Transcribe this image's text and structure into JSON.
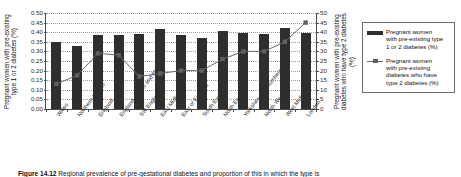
{
  "chart_data": {
    "type": "bar",
    "title": "",
    "categories": [
      "Wales",
      "Northern Ireland",
      "England",
      "England, Wales and NI",
      "SW England",
      "East Midlands",
      "East of England",
      "South East",
      "North East",
      "Yorkshire and Humberside",
      "North West",
      "West Midlands",
      "London"
    ],
    "series": [
      {
        "name": "Pregnant women with pre-existing type 1 or 2 diabetes (%)",
        "type": "bar",
        "axis": "left",
        "values": [
          0.35,
          0.33,
          0.385,
          0.385,
          0.39,
          0.415,
          0.385,
          0.37,
          0.405,
          0.395,
          0.39,
          0.42,
          0.395
        ]
      },
      {
        "name": "Pregnant women with pre-existing diabetes who have type 2 diabetes (%)",
        "type": "line",
        "axis": "right",
        "values": [
          13,
          17.5,
          29,
          28,
          17,
          18.5,
          20,
          20,
          26,
          30,
          30,
          35,
          45
        ]
      }
    ],
    "ylabel": "Pregnant women with pre-existing type 1 or 2 diabetes (%)",
    "ylabel_right": "Pregnant women with pre-existing diabetes who have type 2 diabetes (%)",
    "xlabel": "",
    "ylim": [
      0.0,
      0.5
    ],
    "ylim_right": [
      0,
      50
    ],
    "yticks": [
      "0.00",
      "0.05",
      "0.10",
      "0.15",
      "0.20",
      "0.25",
      "0.30",
      "0.35",
      "0.40",
      "0.45",
      "0.50"
    ],
    "yticks_right": [
      "0",
      "5",
      "10",
      "15",
      "20",
      "25",
      "30",
      "35",
      "40",
      "45",
      "50"
    ],
    "grid": true,
    "legend_position": "right"
  },
  "legend": {
    "entries": [
      {
        "label": "Pregnant women\nwith pre-existing type\n1 or 2 diabetes (%)",
        "key": "bar-swatch"
      },
      {
        "label": "Pregnant women\nwith pre-existing\ndiabetes who have\ntype 2 diabetes (%)",
        "key": "line-marker-swatch"
      }
    ]
  },
  "caption": {
    "number": "Figure 14.12",
    "text": " Regional prevalence of pre-gestational diabetes and proportion of this in which the type is"
  },
  "colors": {
    "bar": "#2e2e2e",
    "line": "#6a6a6a",
    "marker": "#5f5f5f",
    "axis": "#4a4a4a",
    "grid": "#9a9a9a"
  }
}
